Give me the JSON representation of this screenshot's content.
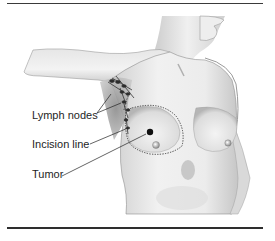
{
  "figure": {
    "labels": {
      "lymph_nodes": "Lymph nodes",
      "incision_line": "Incision line",
      "tumor": "Tumor"
    },
    "colors": {
      "rule": "#3a3a3a",
      "skin_light": "#f2f2f2",
      "skin_mid": "#d4d4d4",
      "skin_shadow": "#9a9a9a",
      "outline": "#555555",
      "tumor": "#111111",
      "label_text": "#1e1e1e"
    }
  }
}
